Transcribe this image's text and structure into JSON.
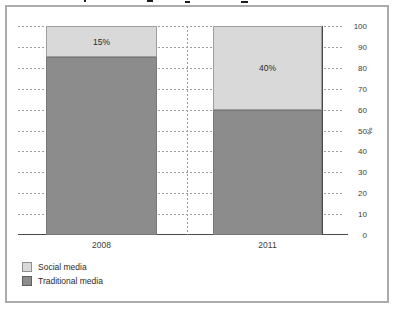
{
  "chart_data": {
    "type": "bar",
    "stacked": true,
    "categories": [
      "2008",
      "2011"
    ],
    "series": [
      {
        "name": "Social media",
        "color": "#d9d9d9",
        "border": "#9e9e9e",
        "values": [
          15,
          40
        ]
      },
      {
        "name": "Traditional media",
        "color": "#8c8c8c",
        "border": "#787878",
        "values": [
          85,
          60
        ]
      }
    ],
    "segment_labels": [
      {
        "category": "2008",
        "series": "Social media",
        "text": "15%"
      },
      {
        "category": "2011",
        "series": "Social media",
        "text": "40%"
      }
    ],
    "ylabel": "%",
    "ylim": [
      0,
      100
    ],
    "yticks": [
      100,
      90,
      80,
      70,
      60,
      50,
      40,
      30,
      20,
      10,
      0
    ],
    "y_axis_side": "right",
    "grid": "horizontal-dotted",
    "legend_position": "bottom-left",
    "axis_color": "#4a4a4a",
    "gridline_color": "#9c9c9c"
  },
  "legend": {
    "items": [
      {
        "label": "Social media",
        "swatch_color": "#d9d9d9",
        "swatch_border": "#8f8f8f"
      },
      {
        "label": "Traditional media",
        "swatch_color": "#8c8c8c",
        "swatch_border": "#5f5f5f"
      }
    ]
  }
}
